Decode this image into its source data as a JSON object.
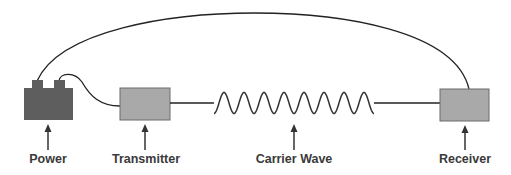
{
  "diagram": {
    "title": "",
    "colors": {
      "background": "#ffffff",
      "wire": "#222222",
      "power_fill": "#5e5e5e",
      "box_fill": "#a9a9a9",
      "box_stroke": "#6a6a6a",
      "arrow": "#333333",
      "label": "#3a3a3a"
    },
    "components": [
      {
        "id": "power",
        "label": "Power",
        "shape": "battery"
      },
      {
        "id": "transmitter",
        "label": "Transmitter",
        "shape": "box"
      },
      {
        "id": "carrier_wave",
        "label": "Carrier Wave",
        "shape": "sine-wave",
        "peaks": 8
      },
      {
        "id": "receiver",
        "label": "Receiver",
        "shape": "box"
      }
    ],
    "connections": [
      {
        "from": "power",
        "to": "transmitter",
        "type": "wire"
      },
      {
        "from": "transmitter",
        "to": "carrier_wave",
        "type": "wire"
      },
      {
        "from": "carrier_wave",
        "to": "receiver",
        "type": "wire"
      },
      {
        "from": "power",
        "to": "receiver",
        "type": "arc-wire"
      }
    ]
  }
}
